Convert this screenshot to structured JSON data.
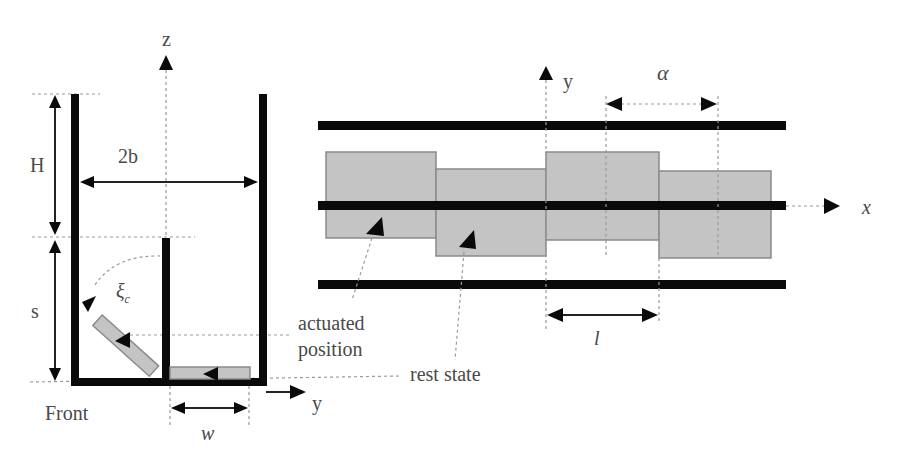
{
  "figure": {
    "left_panel": {
      "name": "front-view",
      "labels": {
        "z_axis": "z",
        "y_axis": "y",
        "height_H": "H",
        "width_2b": "2b",
        "depth_s": "s",
        "angle_xi": "ξ",
        "angle_xi_sub": "c",
        "width_w": "w",
        "view": "Front",
        "actuated_line1": "actuated",
        "actuated_line2": "position",
        "rest": "rest state"
      }
    },
    "right_panel": {
      "name": "top-view",
      "labels": {
        "y_axis": "y",
        "x_axis": "x",
        "pitch_alpha": "α",
        "length_l": "l"
      }
    },
    "colors": {
      "wall": "#0a0a0a",
      "plate": "#c4c4c4",
      "text": "#4a4a4a",
      "guide": "#9a9a9a"
    }
  }
}
